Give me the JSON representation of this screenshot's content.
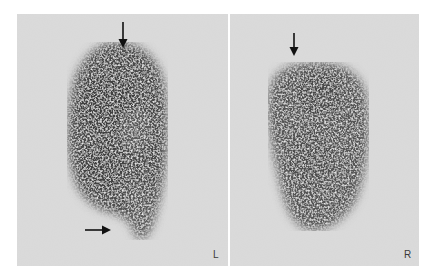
{
  "figure": {
    "panels": [
      {
        "id": "left",
        "side_label": "L",
        "background": "#d8d8d8",
        "uptake_color": "#3c3c3c",
        "arrows": [
          {
            "direction": "down",
            "position": "top of uptake"
          },
          {
            "direction": "right",
            "position": "lower left of uptake"
          }
        ]
      },
      {
        "id": "right",
        "side_label": "R",
        "background": "#d8d8d8",
        "uptake_color": "#4a4a4a",
        "arrows": [
          {
            "direction": "down",
            "position": "top-left of uptake"
          }
        ]
      }
    ]
  }
}
